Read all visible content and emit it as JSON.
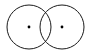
{
  "figure": {
    "type": "geometric-diagram",
    "canvas": {
      "width": 90,
      "height": 54,
      "background_color": "#ffffff",
      "has_frame": false
    },
    "style": {
      "stroke_color": "#1a1a1a",
      "stroke_width": 1,
      "dot_color": "#000000",
      "dot_radius": 1.4,
      "fill": "none"
    },
    "shapes": [
      {
        "name": "left-circle",
        "kind": "circle",
        "cx": 29,
        "cy": 27,
        "r": 22,
        "label": ""
      },
      {
        "name": "right-circle",
        "kind": "circle",
        "cx": 62,
        "cy": 27,
        "r": 22,
        "label": ""
      }
    ],
    "points": [
      {
        "name": "left-center-dot",
        "kind": "center-point",
        "cx": 29,
        "cy": 27,
        "label": ""
      },
      {
        "name": "right-center-dot",
        "kind": "center-point",
        "cx": 62,
        "cy": 27,
        "label": ""
      }
    ],
    "intersections": [
      {
        "name": "upper-intersection",
        "cx": 45.5,
        "cy": 5.6
      },
      {
        "name": "lower-intersection",
        "cx": 45.5,
        "cy": 48.4
      }
    ],
    "annotations": []
  }
}
